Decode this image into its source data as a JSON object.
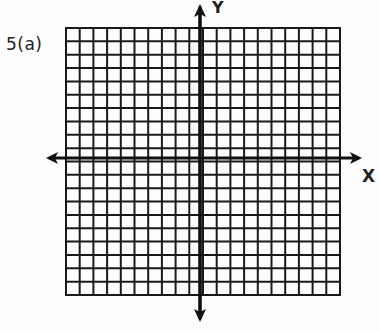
{
  "problem": {
    "label": "5(a)"
  },
  "axes": {
    "x_label": "X",
    "y_label": "Y"
  },
  "grid": {
    "columns": 20,
    "rows": 20,
    "left": 66,
    "top": 28,
    "right": 340,
    "bottom": 295,
    "x_axis_y": 158,
    "y_axis_x": 200,
    "line_color": "#1a1a1a",
    "axis_color": "#111111"
  }
}
